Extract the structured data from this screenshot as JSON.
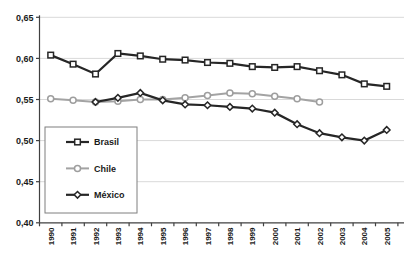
{
  "colors": {
    "background": "#ffffff",
    "gridline": "#d9d9d9",
    "axis": "#404040",
    "tick_text": "#1a1a1a",
    "legend_border": "#7f7f7f",
    "marker_fill": "#ffffff",
    "dark_series": "#262626",
    "gray_series": "#a3a3a3"
  },
  "chart_data": {
    "type": "line",
    "title": "",
    "xlabel": "",
    "ylabel": "",
    "ylim": [
      0.4,
      0.65
    ],
    "y_tick_step": 0.05,
    "decimal_separator": ",",
    "grid": "horizontal",
    "y_tick_labels": [
      "0,65",
      "0,60",
      "0,55",
      "0,50",
      "0,45",
      "0,40"
    ],
    "y_tick_values": [
      0.65,
      0.6,
      0.55,
      0.5,
      0.45,
      0.4
    ],
    "x_tick_labels": [
      "1990",
      "1991",
      "1992",
      "1993",
      "1994",
      "1995",
      "1996",
      "1997",
      "1998",
      "1999",
      "2000",
      "2001",
      "2002",
      "2003",
      "2004",
      "2005"
    ],
    "legend": {
      "position": "inside-bottom-left",
      "entries": [
        "Brasil",
        "Chile",
        "México"
      ]
    },
    "series": [
      {
        "name": "Brasil",
        "marker": "square",
        "color": "#262626",
        "years": [
          1990,
          1991,
          1992,
          1993,
          1994,
          1995,
          1996,
          1997,
          1998,
          1999,
          2000,
          2001,
          2002,
          2003,
          2004,
          2005
        ],
        "values": [
          0.604,
          0.593,
          0.581,
          0.606,
          0.603,
          0.599,
          0.598,
          0.595,
          0.594,
          0.59,
          0.589,
          0.59,
          0.585,
          0.58,
          0.569,
          0.566
        ]
      },
      {
        "name": "Chile",
        "marker": "circle",
        "color": "#a3a3a3",
        "years": [
          1990,
          1991,
          1992,
          1993,
          1994,
          1995,
          1996,
          1997,
          1998,
          1999,
          2000,
          2001,
          2002
        ],
        "values": [
          0.551,
          0.549,
          0.547,
          0.548,
          0.55,
          0.55,
          0.552,
          0.555,
          0.558,
          0.557,
          0.554,
          0.551,
          0.547
        ]
      },
      {
        "name": "México",
        "marker": "diamond",
        "color": "#262626",
        "years": [
          1992,
          1993,
          1994,
          1995,
          1996,
          1997,
          1998,
          1999,
          2000,
          2001,
          2002,
          2003,
          2004,
          2005
        ],
        "values": [
          0.547,
          0.552,
          0.558,
          0.549,
          0.544,
          0.543,
          0.541,
          0.539,
          0.534,
          0.52,
          0.509,
          0.504,
          0.5,
          0.513
        ]
      }
    ]
  }
}
